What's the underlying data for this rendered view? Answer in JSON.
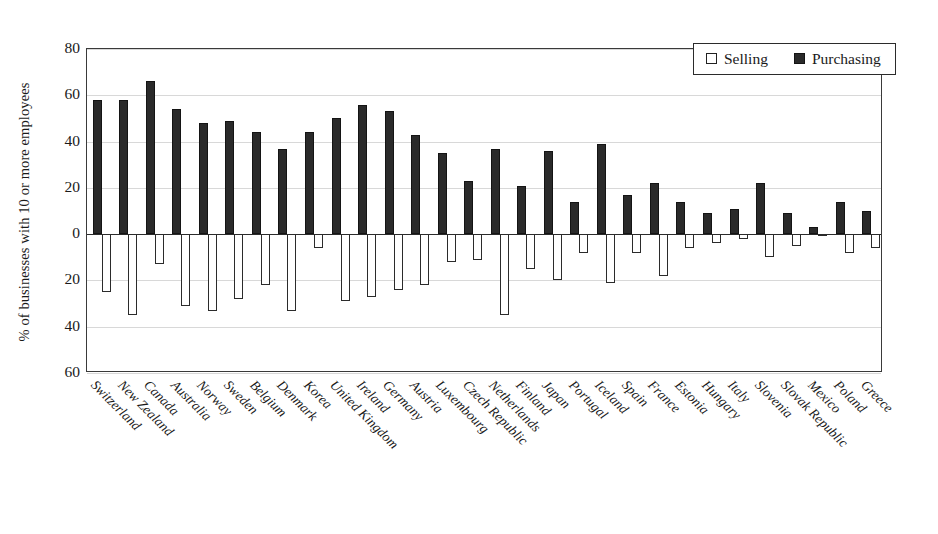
{
  "chart_data": {
    "type": "bar",
    "title": "",
    "subtitle": "",
    "xlabel": "",
    "ylabel": "% of businesses with 10 or more employees",
    "ylim": [
      -60,
      80
    ],
    "yticks": [
      80,
      60,
      40,
      20,
      0,
      20,
      40,
      60
    ],
    "ytick_values": [
      80,
      60,
      40,
      20,
      0,
      -20,
      -40,
      -60
    ],
    "grid": true,
    "legend_position": "top-right",
    "note": "Selling values are plotted downward (below the zero line) as positive magnitudes; Purchasing plotted upward.",
    "categories": [
      "Switzerland",
      "New Zealand",
      "Canada",
      "Australia",
      "Norway",
      "Sweden",
      "Belgium",
      "Denmark",
      "Korea",
      "United Kingdom",
      "Ireland",
      "Germany",
      "Austria",
      "Luxembourg",
      "Czech Republic",
      "Netherlands",
      "Finland",
      "Japan",
      "Portugal",
      "Iceland",
      "Spain",
      "France",
      "Estonia",
      "Hungary",
      "Italy",
      "Slovenia",
      "Slovak Republic",
      "Mexico",
      "Poland",
      "Greece"
    ],
    "series": [
      {
        "name": "Purchasing",
        "color": "#2a2a2a",
        "values": [
          58,
          58,
          66,
          54,
          48,
          49,
          44,
          37,
          44,
          50,
          56,
          53,
          43,
          35,
          23,
          37,
          21,
          36,
          14,
          39,
          17,
          22,
          14,
          9,
          11,
          22,
          9,
          3,
          14,
          10
        ]
      },
      {
        "name": "Selling",
        "color": "#ffffff",
        "values": [
          25,
          35,
          13,
          31,
          33,
          28,
          22,
          33,
          6,
          29,
          27,
          24,
          22,
          12,
          11,
          35,
          15,
          20,
          8,
          21,
          8,
          18,
          6,
          4,
          2,
          10,
          5,
          1,
          8,
          6
        ]
      }
    ]
  },
  "legend": {
    "items": [
      {
        "label": "Selling",
        "style": "open"
      },
      {
        "label": "Purchasing",
        "style": "filled"
      }
    ]
  },
  "axis": {
    "y_title": "% of businesses with 10 or more employees"
  }
}
